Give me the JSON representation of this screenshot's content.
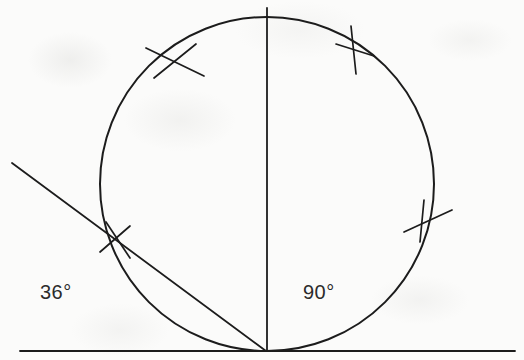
{
  "figure": {
    "kind": "geometry-construction-diagram",
    "background_color": "#fbfbfa",
    "ink_color": "#1c1c1c",
    "labels": [
      {
        "id": "label-36",
        "text": "36°",
        "x": 62,
        "y": 293,
        "color": "#2b2b2b",
        "font_size": 20
      },
      {
        "id": "label-90",
        "text": "90°",
        "x": 325,
        "y": 293,
        "color": "#2b2b2b",
        "font_size": 20
      }
    ],
    "baseline": {
      "name": "horizontal-baseline",
      "x1": 20,
      "y1": 351,
      "x2": 515,
      "y2": 351,
      "stroke_width": 1.8
    },
    "circle": {
      "name": "main-circle",
      "cx": 267,
      "cy": 184,
      "r": 167,
      "stroke_width": 2.0
    },
    "vertical_diameter": {
      "name": "vertical-diameter-line",
      "x1": 267,
      "y1": 8,
      "x2": 267,
      "y2": 351,
      "stroke_width": 1.8
    },
    "chord": {
      "name": "oblique-chord-line",
      "x1": 12,
      "y1": 163,
      "x2": 266,
      "y2": 351,
      "stroke_width": 1.8
    },
    "tangent_point": {
      "name": "tangent-vertex",
      "x": 266,
      "y": 351
    },
    "tick_marks": [
      {
        "name": "arc-tick-upper-left",
        "type": "cross",
        "strokes": [
          {
            "x1": 146,
            "y1": 48,
            "x2": 204,
            "y2": 76
          },
          {
            "x1": 154,
            "y1": 78,
            "x2": 196,
            "y2": 44
          }
        ]
      },
      {
        "name": "arc-tick-upper-right",
        "type": "cross",
        "strokes": [
          {
            "x1": 351,
            "y1": 26,
            "x2": 356,
            "y2": 74
          },
          {
            "x1": 336,
            "y1": 44,
            "x2": 374,
            "y2": 56
          }
        ]
      },
      {
        "name": "arc-tick-right",
        "type": "cross",
        "strokes": [
          {
            "x1": 424,
            "y1": 200,
            "x2": 420,
            "y2": 242
          },
          {
            "x1": 404,
            "y1": 232,
            "x2": 452,
            "y2": 210
          }
        ]
      },
      {
        "name": "arc-tick-lower-left",
        "type": "cross",
        "strokes": [
          {
            "x1": 100,
            "y1": 252,
            "x2": 130,
            "y2": 226
          },
          {
            "x1": 106,
            "y1": 222,
            "x2": 130,
            "y2": 258
          }
        ]
      }
    ]
  }
}
